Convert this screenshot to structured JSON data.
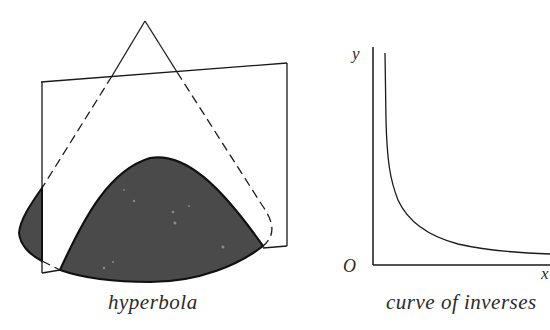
{
  "figure": {
    "left_panel": {
      "caption": "hyperbola",
      "description": "cone cut by a vertical plane producing a hyperbola section",
      "colors": {
        "stroke": "#1a1a1a",
        "section_fill": "#4a4a4a",
        "background": "#ffffff"
      }
    },
    "right_panel": {
      "caption": "curve of inverses",
      "axes": {
        "y_label": "y",
        "x_label": "x",
        "origin_label": "O"
      },
      "curve": "y = k/x",
      "colors": {
        "stroke": "#1a1a1a"
      }
    }
  }
}
